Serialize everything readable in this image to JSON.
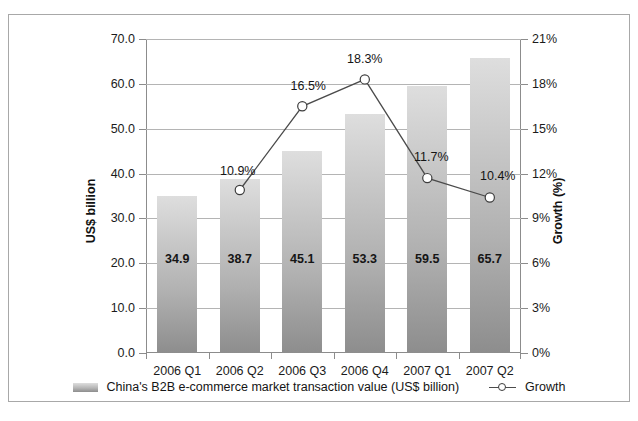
{
  "chart_data": {
    "type": "bar",
    "title": "",
    "categories": [
      "2006 Q1",
      "2006 Q2",
      "2006 Q3",
      "2006 Q4",
      "2007 Q1",
      "2007 Q2"
    ],
    "series": [
      {
        "name": "China's B2B e-commerce market transaction value (US$ billion)",
        "type": "bar",
        "axis": "left",
        "values": [
          34.9,
          38.7,
          45.1,
          53.3,
          59.5,
          65.7
        ],
        "value_labels": [
          "34.9",
          "38.7",
          "45.1",
          "53.3",
          "59.5",
          "65.7"
        ]
      },
      {
        "name": "Growth",
        "type": "line",
        "axis": "right",
        "values": [
          null,
          10.9,
          16.5,
          18.3,
          11.7,
          10.4
        ],
        "value_labels": [
          "",
          "10.9%",
          "16.5%",
          "18.3%",
          "11.7%",
          "10.4%"
        ]
      }
    ],
    "xlabel": "",
    "ylabel": "US$ billion",
    "y2label": "Growth (%)",
    "ylim": [
      0.0,
      70.0
    ],
    "yticks": [
      "0.0",
      "10.0",
      "20.0",
      "30.0",
      "40.0",
      "50.0",
      "60.0",
      "70.0"
    ],
    "y2lim": [
      0,
      21
    ],
    "y2ticks": [
      "0%",
      "3%",
      "6%",
      "9%",
      "12%",
      "15%",
      "18%",
      "21%"
    ],
    "grid": true,
    "legend_position": "bottom",
    "colors": {
      "bar_top": "#dedede",
      "bar_bottom": "#8d8d8d",
      "line": "#4b4b4b",
      "marker_fill": "#ffffff",
      "gridline": "#b4b4b4",
      "axis": "#8c8c8c",
      "text": "#151515",
      "border": "#a8a8a8"
    }
  },
  "legend": {
    "bar_label": "China's B2B e-commerce market transaction value (US$ billion)",
    "line_label": "Growth"
  }
}
